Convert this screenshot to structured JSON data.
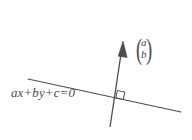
{
  "figure": {
    "background_color": "#ffffff",
    "stroke_color": "#4d4d4d",
    "canvas": {
      "width": 192,
      "height": 140
    },
    "line_label": "ax+by+c=0",
    "vector_label": {
      "open_paren": "(",
      "close_paren": ")",
      "top_component": "a",
      "bottom_component": "b"
    },
    "geometry": {
      "straight_line": {
        "x1": 28,
        "y1": 79,
        "x2": 181,
        "y2": 112
      },
      "normal_arrow": {
        "x1": 110,
        "y1": 127,
        "x2": 123,
        "y2": 41
      },
      "right_angle_marker": {
        "x": 116,
        "y": 91,
        "size": 8
      },
      "intersection": {
        "x": 117,
        "y": 97
      }
    }
  }
}
